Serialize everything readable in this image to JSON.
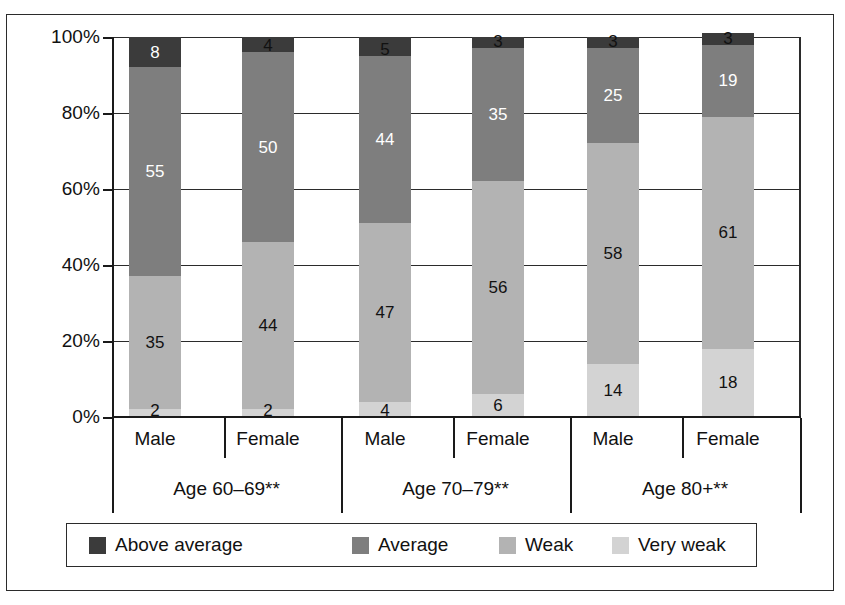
{
  "chart_data": {
    "type": "bar",
    "subtype": "stacked-percentage",
    "title": "",
    "xlabel": "",
    "ylabel": "",
    "ylim": [
      0,
      100
    ],
    "yticks": [
      "0%",
      "20%",
      "40%",
      "60%",
      "80%",
      "100%"
    ],
    "ytick_values": [
      0,
      20,
      40,
      60,
      80,
      100
    ],
    "grid": true,
    "legend_position": "bottom",
    "categories": [
      "Male",
      "Female",
      "Male",
      "Female",
      "Male",
      "Female"
    ],
    "groups": [
      {
        "label": "Age 60–69**",
        "members": [
          "Male",
          "Female"
        ]
      },
      {
        "label": "Age 70–79**",
        "members": [
          "Male",
          "Female"
        ]
      },
      {
        "label": "Age 80+**",
        "members": [
          "Male",
          "Female"
        ]
      }
    ],
    "series": [
      {
        "name": "Above average",
        "color": "#3b3b3b",
        "values": [
          8,
          4,
          5,
          3,
          3,
          3
        ]
      },
      {
        "name": "Average",
        "color": "#7e7e7e",
        "values": [
          55,
          50,
          44,
          35,
          25,
          19
        ]
      },
      {
        "name": "Weak",
        "color": "#b3b3b3",
        "values": [
          35,
          44,
          47,
          56,
          58,
          61
        ]
      },
      {
        "name": "Very weak",
        "color": "#d3d3d3",
        "values": [
          2,
          2,
          4,
          6,
          14,
          18
        ]
      }
    ],
    "bars": [
      {
        "group": "Age 60–69**",
        "sex": "Male",
        "segments": [
          8,
          55,
          35,
          2
        ]
      },
      {
        "group": "Age 60–69**",
        "sex": "Female",
        "segments": [
          4,
          50,
          44,
          2
        ]
      },
      {
        "group": "Age 70–79**",
        "sex": "Male",
        "segments": [
          5,
          44,
          47,
          4
        ]
      },
      {
        "group": "Age 70–79**",
        "sex": "Female",
        "segments": [
          3,
          35,
          56,
          6
        ]
      },
      {
        "group": "Age 80+**",
        "sex": "Male",
        "segments": [
          3,
          25,
          58,
          14
        ]
      },
      {
        "group": "Age 80+**",
        "sex": "Female",
        "segments": [
          3,
          19,
          61,
          18
        ]
      }
    ]
  },
  "axis": {
    "y_tick_labels": [
      "100%",
      "80%",
      "60%",
      "40%",
      "20%",
      "0%"
    ]
  },
  "x_axis": {
    "sex_labels": [
      "Male",
      "Female",
      "Male",
      "Female",
      "Male",
      "Female"
    ],
    "group_labels": [
      "Age 60–69**",
      "Age 70–79**",
      "Age 80+**"
    ]
  },
  "legend": {
    "items": [
      {
        "label": "Above average",
        "color": "#3b3b3b"
      },
      {
        "label": "Average",
        "color": "#7e7e7e"
      },
      {
        "label": "Weak",
        "color": "#b3b3b3"
      },
      {
        "label": "Very weak",
        "color": "#d3d3d3"
      }
    ]
  }
}
